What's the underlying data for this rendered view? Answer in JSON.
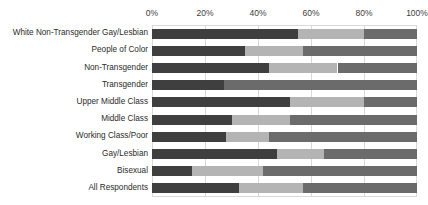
{
  "chart_data": {
    "type": "bar",
    "orientation": "horizontal",
    "stacked": true,
    "stacked_percent": true,
    "title": "",
    "subtitle": "",
    "xlabel": "",
    "ylabel": "",
    "xlim": [
      0,
      100
    ],
    "grid": true,
    "legend": "none",
    "xticks": [
      "0%",
      "20%",
      "40%",
      "60%",
      "80%",
      "100%"
    ],
    "xtick_values": [
      0,
      20,
      40,
      60,
      80,
      100
    ],
    "categories": [
      "White Non-Transgender Gay/Lesbian",
      "People of Color",
      "Non-Transgender",
      "Transgender",
      "Upper Middle Class",
      "Middle Class",
      "Working Class/Poor",
      "Gay/Lesbian",
      "Bisexual",
      "All Respondents"
    ],
    "series": [
      {
        "name": "segment-1",
        "color": "#3f3f3f",
        "values": [
          55,
          35,
          44,
          27,
          52,
          30,
          28,
          47,
          15,
          33
        ]
      },
      {
        "name": "segment-2",
        "color": "#b4b4b4",
        "values": [
          25,
          22,
          26,
          0,
          28,
          22,
          16,
          18,
          27,
          24
        ]
      },
      {
        "name": "segment-3",
        "color": "#6b6b6b",
        "values": [
          20,
          43,
          30,
          73,
          20,
          48,
          56,
          35,
          58,
          43
        ]
      }
    ],
    "colors": {
      "segment_1": "#3f3f3f",
      "segment_2": "#b4b4b4",
      "segment_3": "#6b6b6b",
      "gridline": "#d9d9d9",
      "axis_text": "#404040",
      "category_text": "#2b2b2b",
      "background": "#ffffff"
    }
  }
}
